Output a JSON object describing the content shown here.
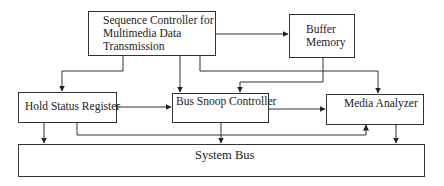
{
  "diagram": {
    "title": "",
    "nodes": {
      "sequence_controller": {
        "lines": [
          "Sequence Controller for",
          "Multimedia Data",
          "Transmission"
        ]
      },
      "buffer_memory": {
        "lines": [
          "Buffer",
          "Memory"
        ]
      },
      "hold_status_register": {
        "label": "Hold Status Register"
      },
      "bus_snoop_controller": {
        "label": "Bus Snoop Controller"
      },
      "media_analyzer": {
        "label": "Media Analyzer"
      },
      "system_bus": {
        "label": "System Bus"
      }
    },
    "edges": [
      {
        "from": "sequence_controller",
        "to": "buffer_memory",
        "direction": "bidirectional"
      },
      {
        "from": "sequence_controller",
        "to": "hold_status_register",
        "direction": "bidirectional"
      },
      {
        "from": "sequence_controller",
        "to": "bus_snoop_controller",
        "direction": "bidirectional"
      },
      {
        "from": "sequence_controller",
        "to": "media_analyzer",
        "direction": "bidirectional"
      },
      {
        "from": "buffer_memory",
        "to": "bus_snoop_controller",
        "direction": "bidirectional"
      },
      {
        "from": "hold_status_register",
        "to": "bus_snoop_controller",
        "direction": "bidirectional"
      },
      {
        "from": "bus_snoop_controller",
        "to": "media_analyzer",
        "direction": "bidirectional"
      },
      {
        "from": "hold_status_register",
        "to": "media_analyzer",
        "direction": "bidirectional"
      },
      {
        "from": "hold_status_register",
        "to": "system_bus",
        "direction": "bidirectional"
      },
      {
        "from": "bus_snoop_controller",
        "to": "system_bus",
        "direction": "bidirectional"
      },
      {
        "from": "media_analyzer",
        "to": "system_bus",
        "direction": "bidirectional"
      }
    ]
  }
}
